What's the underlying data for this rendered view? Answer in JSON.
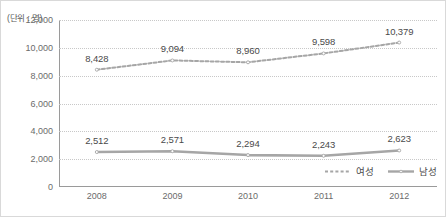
{
  "chart_data": {
    "type": "line",
    "title": "",
    "subtitle": "",
    "unit_caption": "(단위 : 명)",
    "xlabel": "",
    "ylabel": "",
    "categories": [
      "2008",
      "2009",
      "2010",
      "2011",
      "2012"
    ],
    "ylim": [
      0,
      12000
    ],
    "yticks": [
      "0",
      "2,000",
      "4,000",
      "6,000",
      "8,000",
      "10,000",
      "12,000"
    ],
    "ytick_values": [
      0,
      2000,
      4000,
      6000,
      8000,
      10000,
      12000
    ],
    "grid": true,
    "legend_position": "bottom-right",
    "series": [
      {
        "name": "여성",
        "style": "dashed",
        "color": "#a6a6a6",
        "values": [
          8428,
          9094,
          8960,
          9598,
          10379
        ],
        "labels": [
          "8,428",
          "9,094",
          "8,960",
          "9,598",
          "10,379"
        ]
      },
      {
        "name": "남성",
        "style": "solid",
        "color": "#a6a6a6",
        "values": [
          2512,
          2571,
          2294,
          2243,
          2623
        ],
        "labels": [
          "2,512",
          "2,571",
          "2,294",
          "2,243",
          "2,623"
        ]
      }
    ]
  },
  "colors": {
    "axis": "#9a9a9a",
    "gridline": "#c8c8c8",
    "series_line": "#a6a6a6",
    "text": "#5a5a5a",
    "border": "#d9d9d9"
  }
}
